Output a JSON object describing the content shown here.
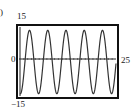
{
  "part_label": ")",
  "chart_data": {
    "type": "line",
    "title": "",
    "xlabel": "",
    "ylabel": "",
    "xlim": [
      0,
      25
    ],
    "ylim": [
      -15,
      15
    ],
    "tick_labels": {
      "ymax": "15",
      "ymin": "-15",
      "origin": "0",
      "xmax": "25"
    },
    "grid": false,
    "legend": null,
    "series": [
      {
        "name": "oscillation",
        "description": "sinusoid, ~5 peaks over 0..25, amplitude ~14",
        "x": [
          0,
          1,
          2,
          3,
          4,
          5,
          6,
          7,
          8,
          9,
          10,
          11,
          12,
          13,
          14,
          15,
          16,
          17,
          18,
          19,
          20,
          21,
          22,
          23,
          24,
          25
        ],
        "values": [
          -14,
          1,
          14,
          3,
          -13,
          -7,
          10,
          11,
          -6,
          -13,
          1,
          14,
          4,
          -12,
          -8,
          9,
          12,
          -5,
          -14,
          -1,
          13,
          6,
          -11,
          -10,
          7,
          13
        ]
      }
    ]
  },
  "display_labels": {
    "y_top": "15",
    "y_bottom": "−15",
    "origin": "0",
    "x_right": "25"
  }
}
